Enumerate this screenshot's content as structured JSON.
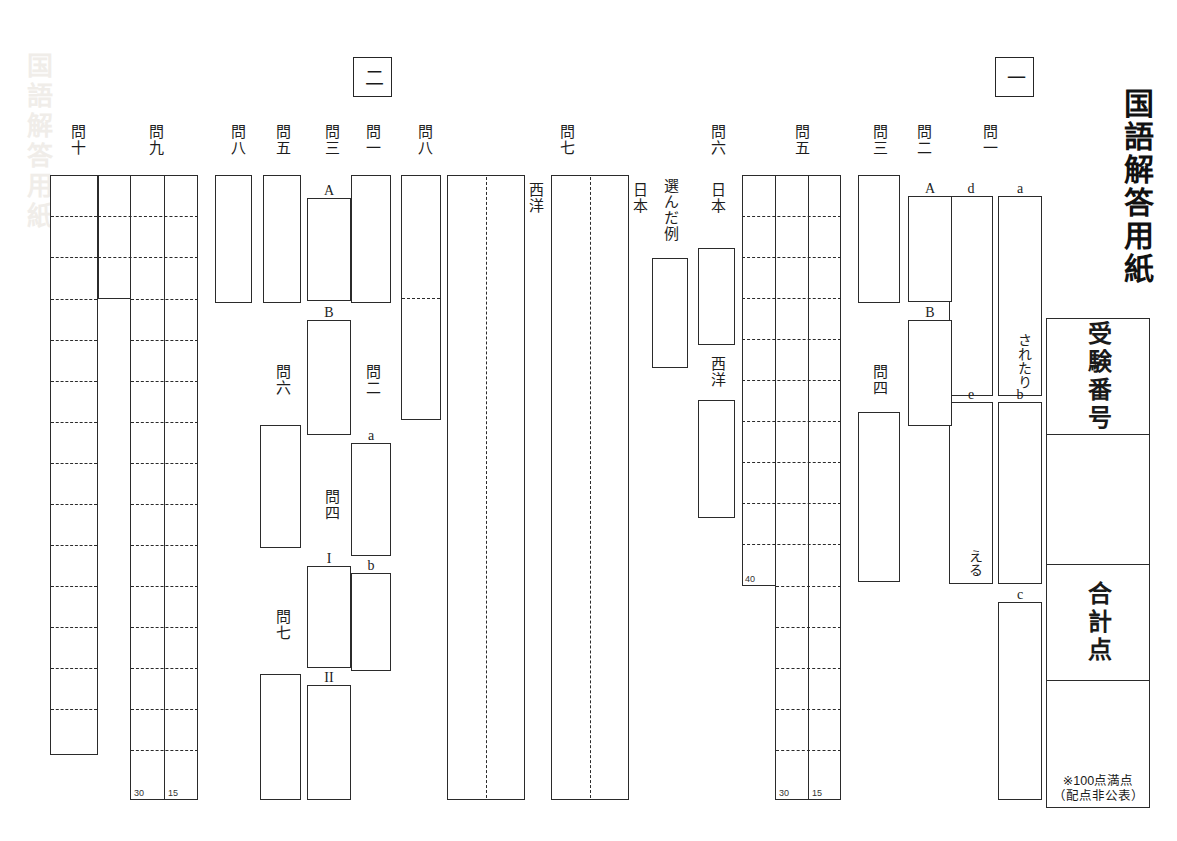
{
  "sheet": {
    "title": "国語解答用紙",
    "watermark": "国語解答用紙",
    "score_panel": {
      "exam_number_label": "受験番号",
      "total_score_label": "合計点",
      "exam_number_value": "",
      "total_score_value": "",
      "note_line1": "※100点満点",
      "note_line2": "（配点非公表）"
    }
  },
  "sections": [
    {
      "id": "section-1",
      "marker": "一",
      "questions": [
        {
          "id": "q1-1",
          "label": "問一",
          "sublabels": [
            "a",
            "b",
            "c",
            "d",
            "e"
          ],
          "prefilled": {
            "a": "されたり",
            "e": "える"
          }
        },
        {
          "id": "q1-2",
          "label": "問二",
          "sublabels": [
            "A",
            "B"
          ]
        },
        {
          "id": "q1-3",
          "label": "問三",
          "sublabels": []
        },
        {
          "id": "q1-4",
          "label": "問四",
          "sublabels": []
        },
        {
          "id": "q1-5",
          "label": "問五",
          "sublabels": [],
          "counts": [
            "40",
            "30",
            "15"
          ]
        },
        {
          "id": "q1-6",
          "label": "問六",
          "sublabels": [
            "日本",
            "西洋"
          ],
          "example_label": "選んだ例"
        },
        {
          "id": "q1-7",
          "label": "問七",
          "sublabels": [
            "日本",
            "西洋"
          ]
        },
        {
          "id": "q1-8",
          "label": "問八",
          "sublabels": []
        }
      ]
    },
    {
      "id": "section-2",
      "marker": "二",
      "questions": [
        {
          "id": "q2-1",
          "label": "問一",
          "sublabels": []
        },
        {
          "id": "q2-2",
          "label": "問二",
          "sublabels": [
            "a",
            "b"
          ]
        },
        {
          "id": "q2-3",
          "label": "問三",
          "sublabels": [
            "A",
            "B"
          ]
        },
        {
          "id": "q2-4",
          "label": "問四",
          "sublabels": [
            "I",
            "II"
          ]
        },
        {
          "id": "q2-5",
          "label": "問五",
          "sublabels": []
        },
        {
          "id": "q2-6",
          "label": "問六",
          "sublabels": []
        },
        {
          "id": "q2-7",
          "label": "問七",
          "sublabels": []
        },
        {
          "id": "q2-8",
          "label": "問八",
          "sublabels": []
        },
        {
          "id": "q2-9",
          "label": "問九",
          "sublabels": [],
          "counts": [
            "30",
            "15"
          ]
        },
        {
          "id": "q2-10",
          "label": "問十",
          "sublabels": []
        }
      ]
    }
  ],
  "colors": {
    "ink": "#2b2b2b",
    "paper": "#ffffff"
  }
}
